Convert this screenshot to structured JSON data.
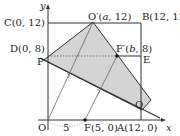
{
  "diagram": {
    "axes": {
      "x_label": "x",
      "y_label": "y",
      "origin_label": "O"
    },
    "points": {
      "C": "C(0, 12)",
      "B": "B(12, 12)",
      "D": "D(0, 8)",
      "P": "P",
      "E": "E",
      "O_prime_prefix": "O′(",
      "O_prime_var": "a",
      "O_prime_suffix": ", 12)",
      "F_prime_prefix": "F′(",
      "F_prime_var": "b",
      "F_prime_suffix": ", 8)",
      "F": "F(5, 0)",
      "A": "A(12, 0)",
      "Q": "Q"
    },
    "segment_label_OF": "5",
    "colors": {
      "shaded_region": "#d4d4d4",
      "lines": "#333333"
    }
  }
}
